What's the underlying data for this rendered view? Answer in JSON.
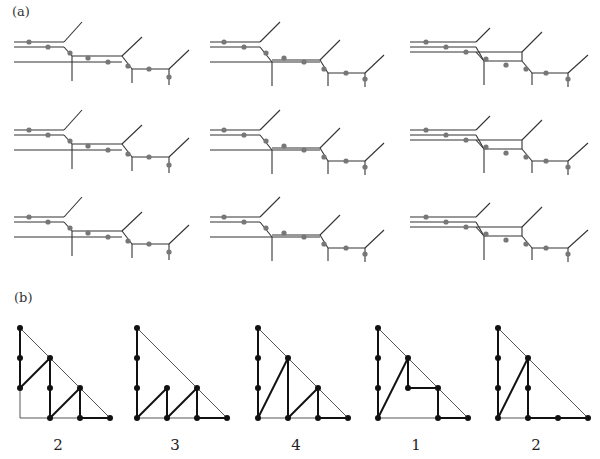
{
  "figure": {
    "label_a": "(a)",
    "label_b": "(b)",
    "line_color": "#333333",
    "dot_color_a": "#777777",
    "dot_color_b": "#111111"
  },
  "panels_a": [
    {
      "ox": 14,
      "oy": 15,
      "segs": [
        [
          0,
          27,
          50,
          27
        ],
        [
          0,
          32,
          50,
          32
        ],
        [
          0,
          47,
          58,
          47
        ],
        [
          50,
          27,
          68,
          7
        ],
        [
          50,
          32,
          58,
          41
        ],
        [
          58,
          41,
          58,
          66
        ],
        [
          58,
          41,
          108,
          41
        ],
        [
          58,
          47,
          108,
          47
        ],
        [
          108,
          41,
          128,
          22
        ],
        [
          108,
          41,
          118,
          54
        ],
        [
          118,
          54,
          118,
          68
        ],
        [
          118,
          54,
          155,
          54
        ],
        [
          155,
          54,
          175,
          35
        ],
        [
          155,
          54,
          155,
          70
        ]
      ],
      "dots": [
        [
          15,
          27
        ],
        [
          34,
          32
        ],
        [
          56,
          38
        ],
        [
          74,
          43
        ],
        [
          94,
          47
        ],
        [
          114,
          51
        ],
        [
          135,
          54
        ],
        [
          155,
          62
        ]
      ]
    },
    {
      "ox": 210,
      "oy": 15,
      "segs": [
        [
          0,
          27,
          50,
          27
        ],
        [
          0,
          32,
          50,
          32
        ],
        [
          0,
          47,
          62,
          47
        ],
        [
          50,
          27,
          70,
          7
        ],
        [
          50,
          32,
          62,
          47
        ],
        [
          62,
          47,
          62,
          71
        ],
        [
          62,
          47,
          110,
          47
        ],
        [
          62,
          45,
          110,
          45
        ],
        [
          110,
          45,
          130,
          25
        ],
        [
          110,
          45,
          118,
          58
        ],
        [
          118,
          58,
          118,
          71
        ],
        [
          118,
          58,
          155,
          58
        ],
        [
          155,
          58,
          174,
          40
        ],
        [
          155,
          58,
          155,
          72
        ]
      ],
      "dots": [
        [
          14,
          27
        ],
        [
          34,
          32
        ],
        [
          56,
          38
        ],
        [
          74,
          43
        ],
        [
          94,
          47
        ],
        [
          114,
          54
        ],
        [
          136,
          58
        ],
        [
          155,
          64
        ]
      ]
    },
    {
      "ox": 410,
      "oy": 15,
      "segs": [
        [
          0,
          27,
          66,
          27
        ],
        [
          0,
          32,
          66,
          32
        ],
        [
          0,
          37,
          66,
          37
        ],
        [
          66,
          27,
          80,
          13
        ],
        [
          66,
          32,
          74,
          46
        ],
        [
          66,
          37,
          74,
          46
        ],
        [
          74,
          46,
          112,
          46
        ],
        [
          66,
          37,
          112,
          37
        ],
        [
          112,
          37,
          132,
          17
        ],
        [
          112,
          37,
          112,
          46
        ],
        [
          74,
          46,
          74,
          70
        ],
        [
          112,
          46,
          122,
          58
        ],
        [
          122,
          58,
          122,
          70
        ],
        [
          122,
          58,
          158,
          58
        ],
        [
          158,
          58,
          178,
          40
        ],
        [
          158,
          58,
          158,
          72
        ]
      ],
      "dots": [
        [
          16,
          27
        ],
        [
          36,
          32
        ],
        [
          56,
          37
        ],
        [
          76,
          44
        ],
        [
          96,
          50
        ],
        [
          116,
          54
        ],
        [
          136,
          58
        ],
        [
          158,
          64
        ]
      ]
    }
  ],
  "panels_b": [
    {
      "ox": 20,
      "number": "2",
      "thin": [
        [
          0,
          0,
          0,
          90
        ],
        [
          0,
          90,
          90,
          90
        ],
        [
          0,
          0,
          90,
          90
        ]
      ],
      "thick": [
        [
          0,
          0,
          0,
          60
        ],
        [
          0,
          60,
          30,
          30
        ],
        [
          30,
          30,
          30,
          90
        ],
        [
          30,
          90,
          60,
          60
        ],
        [
          60,
          60,
          60,
          90
        ],
        [
          60,
          90,
          90,
          90
        ]
      ],
      "dots": [
        [
          0,
          0
        ],
        [
          0,
          30
        ],
        [
          0,
          60
        ],
        [
          30,
          30
        ],
        [
          30,
          60
        ],
        [
          30,
          90
        ],
        [
          60,
          60
        ],
        [
          60,
          90
        ],
        [
          90,
          90
        ]
      ]
    },
    {
      "ox": 137,
      "number": "3",
      "thin": [
        [
          0,
          0,
          90,
          90
        ],
        [
          0,
          90,
          90,
          90
        ]
      ],
      "thick": [
        [
          0,
          0,
          0,
          90
        ],
        [
          0,
          90,
          30,
          60
        ],
        [
          30,
          60,
          30,
          90
        ],
        [
          30,
          90,
          60,
          60
        ],
        [
          60,
          60,
          60,
          90
        ],
        [
          60,
          90,
          90,
          90
        ]
      ],
      "dots": [
        [
          0,
          0
        ],
        [
          0,
          30
        ],
        [
          0,
          60
        ],
        [
          0,
          90
        ],
        [
          30,
          60
        ],
        [
          30,
          90
        ],
        [
          60,
          60
        ],
        [
          60,
          90
        ],
        [
          90,
          90
        ]
      ]
    },
    {
      "ox": 258,
      "number": "4",
      "thin": [
        [
          0,
          0,
          90,
          90
        ],
        [
          0,
          90,
          90,
          90
        ]
      ],
      "thick": [
        [
          0,
          0,
          0,
          90
        ],
        [
          0,
          90,
          30,
          30
        ],
        [
          30,
          30,
          30,
          90
        ],
        [
          30,
          90,
          60,
          60
        ],
        [
          60,
          60,
          60,
          90
        ],
        [
          60,
          90,
          90,
          90
        ]
      ],
      "dots": [
        [
          0,
          0
        ],
        [
          0,
          30
        ],
        [
          0,
          60
        ],
        [
          0,
          90
        ],
        [
          30,
          30
        ],
        [
          30,
          90
        ],
        [
          60,
          60
        ],
        [
          60,
          90
        ],
        [
          90,
          90
        ]
      ]
    },
    {
      "ox": 378,
      "number": "1",
      "thin": [
        [
          0,
          0,
          90,
          90
        ],
        [
          0,
          90,
          90,
          90
        ]
      ],
      "thick": [
        [
          0,
          0,
          0,
          90
        ],
        [
          0,
          90,
          30,
          30
        ],
        [
          30,
          30,
          30,
          60
        ],
        [
          30,
          60,
          60,
          60
        ],
        [
          60,
          60,
          60,
          90
        ],
        [
          60,
          90,
          90,
          90
        ]
      ],
      "dots": [
        [
          0,
          0
        ],
        [
          0,
          30
        ],
        [
          0,
          60
        ],
        [
          0,
          90
        ],
        [
          30,
          30
        ],
        [
          30,
          60
        ],
        [
          60,
          60
        ],
        [
          60,
          90
        ],
        [
          90,
          90
        ]
      ]
    },
    {
      "ox": 498,
      "number": "2",
      "thin": [
        [
          0,
          0,
          90,
          90
        ],
        [
          0,
          90,
          90,
          90
        ]
      ],
      "thick": [
        [
          0,
          0,
          0,
          90
        ],
        [
          0,
          90,
          30,
          30
        ],
        [
          30,
          30,
          30,
          90
        ],
        [
          30,
          90,
          90,
          90
        ]
      ],
      "dots": [
        [
          0,
          0
        ],
        [
          0,
          30
        ],
        [
          0,
          60
        ],
        [
          0,
          90
        ],
        [
          30,
          30
        ],
        [
          30,
          60
        ],
        [
          30,
          90
        ],
        [
          60,
          90
        ],
        [
          90,
          90
        ]
      ]
    }
  ]
}
